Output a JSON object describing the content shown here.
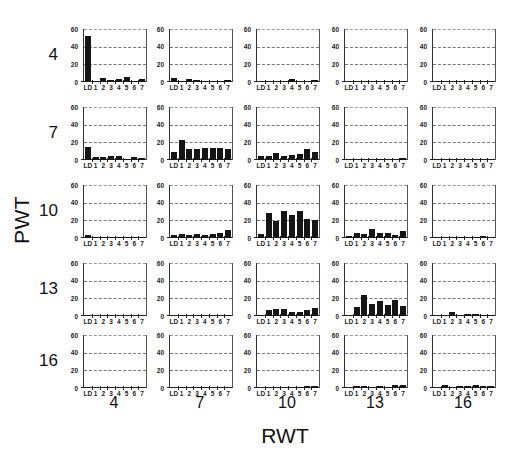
{
  "chart_data": {
    "type": "bar",
    "title": "",
    "xlabel": "RWT",
    "ylabel": "PWT",
    "layout": "5x5 small-multiples grid; rows = PWT, columns = RWT",
    "row_values": [
      "4",
      "7",
      "10",
      "13",
      "16"
    ],
    "col_values": [
      "4",
      "7",
      "10",
      "13",
      "16"
    ],
    "categories": [
      "LD",
      "1",
      "2",
      "3",
      "4",
      "5",
      "6",
      "7"
    ],
    "ylim": [
      0,
      60
    ],
    "yticks": [
      "0",
      "20",
      "40",
      "60"
    ],
    "grid": true,
    "legend": null,
    "panels": [
      {
        "pwt": "4",
        "rwt": "4",
        "values": [
          52,
          1,
          4,
          2,
          3,
          6,
          1,
          3
        ]
      },
      {
        "pwt": "4",
        "rwt": "7",
        "values": [
          5,
          1,
          3,
          2,
          1,
          1,
          1,
          2
        ]
      },
      {
        "pwt": "4",
        "rwt": "10",
        "values": [
          0,
          0,
          0,
          0,
          3,
          0,
          0,
          2
        ]
      },
      {
        "pwt": "4",
        "rwt": "13",
        "values": [
          0,
          0,
          0,
          0,
          0,
          0,
          0,
          0
        ]
      },
      {
        "pwt": "4",
        "rwt": "16",
        "values": [
          0,
          0,
          0,
          0,
          0,
          0,
          0,
          0
        ]
      },
      {
        "pwt": "7",
        "rwt": "4",
        "values": [
          15,
          3,
          3,
          4,
          5,
          1,
          3,
          2
        ]
      },
      {
        "pwt": "7",
        "rwt": "7",
        "values": [
          9,
          23,
          12,
          12,
          14,
          14,
          14,
          13
        ]
      },
      {
        "pwt": "7",
        "rwt": "10",
        "values": [
          4,
          5,
          8,
          4,
          6,
          7,
          12,
          9
        ]
      },
      {
        "pwt": "7",
        "rwt": "13",
        "values": [
          0,
          0,
          0,
          0,
          1,
          0,
          0,
          2
        ]
      },
      {
        "pwt": "7",
        "rwt": "16",
        "values": [
          0,
          0,
          0,
          0,
          0,
          0,
          0,
          0
        ]
      },
      {
        "pwt": "10",
        "rwt": "4",
        "values": [
          3,
          1,
          1,
          1,
          1,
          1,
          1,
          1
        ]
      },
      {
        "pwt": "10",
        "rwt": "7",
        "values": [
          3,
          5,
          3,
          4,
          3,
          5,
          6,
          9
        ]
      },
      {
        "pwt": "10",
        "rwt": "10",
        "values": [
          4,
          28,
          19,
          31,
          26,
          31,
          21,
          20
        ]
      },
      {
        "pwt": "10",
        "rwt": "13",
        "values": [
          2,
          6,
          5,
          10,
          6,
          6,
          3,
          8
        ]
      },
      {
        "pwt": "10",
        "rwt": "16",
        "values": [
          0,
          0,
          1,
          1,
          0,
          1,
          2,
          0
        ]
      },
      {
        "pwt": "13",
        "rwt": "4",
        "values": [
          0,
          0,
          0,
          0,
          0,
          0,
          0,
          0
        ]
      },
      {
        "pwt": "13",
        "rwt": "7",
        "values": [
          0,
          0,
          0,
          0,
          0,
          0,
          0,
          1
        ]
      },
      {
        "pwt": "13",
        "rwt": "10",
        "values": [
          1,
          7,
          8,
          8,
          5,
          4,
          7,
          9
        ]
      },
      {
        "pwt": "13",
        "rwt": "13",
        "values": [
          0,
          10,
          24,
          14,
          17,
          13,
          18,
          11
        ]
      },
      {
        "pwt": "13",
        "rwt": "16",
        "values": [
          0,
          0,
          4,
          1,
          2,
          2,
          1,
          1
        ]
      },
      {
        "pwt": "16",
        "rwt": "4",
        "values": [
          0,
          0,
          0,
          0,
          0,
          0,
          0,
          0
        ]
      },
      {
        "pwt": "16",
        "rwt": "7",
        "values": [
          0,
          0,
          0,
          0,
          0,
          0,
          0,
          0
        ]
      },
      {
        "pwt": "16",
        "rwt": "10",
        "values": [
          0,
          0,
          0,
          0,
          0,
          1,
          2,
          2
        ]
      },
      {
        "pwt": "16",
        "rwt": "13",
        "values": [
          0,
          2,
          2,
          1,
          2,
          1,
          3,
          3
        ]
      },
      {
        "pwt": "16",
        "rwt": "16",
        "values": [
          0,
          3,
          1,
          2,
          2,
          3,
          2,
          2
        ]
      }
    ]
  },
  "labels": {
    "y_title": "PWT",
    "x_title": "RWT"
  },
  "colors": {
    "bar": "#151515",
    "gridline": "#777777",
    "background": "#ffffff"
  }
}
